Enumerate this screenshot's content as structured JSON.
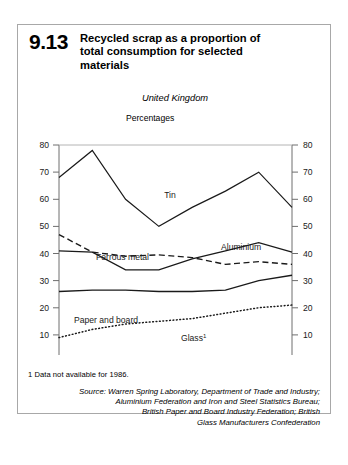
{
  "figure": {
    "number": "9.13",
    "title_line1": "Recycled scrap as a proportion of",
    "title_line2": "total consumption for selected",
    "title_line3": "materials",
    "region": "United Kingdom",
    "units": "Percentages"
  },
  "footnote": {
    "text": "1  Data not available for 1986."
  },
  "source": {
    "line1": "Source: Warren Spring Laboratory, Department of Trade and Industry;",
    "line2": "Aluminium Federation and Iron and Steel Statistics Bureau;",
    "line3": "British Paper and Board Industry Federation; British",
    "line4": "Glass Manufacturers Confederation"
  },
  "axis": {
    "y_ticks": [
      "80",
      "70",
      "60",
      "50",
      "40",
      "30",
      "20",
      "10",
      "0"
    ],
    "x_ticks": [
      "1984",
      "1986",
      "1988",
      "1991"
    ]
  },
  "series_labels": {
    "tin": "Tin",
    "ferrous": "Ferrous metal",
    "aluminium": "Aluminium",
    "paper": "Paper and board",
    "glass": "Glass",
    "glass_footnote_mark": "1"
  },
  "chart_data": {
    "type": "line",
    "title": "Recycled scrap as a proportion of total consumption for selected materials",
    "subtitle": "United Kingdom",
    "xlabel": "",
    "ylabel": "Percentages",
    "ylim": [
      0,
      80
    ],
    "xlim": [
      1984,
      1991
    ],
    "ytick_values": [
      0,
      10,
      20,
      30,
      40,
      50,
      60,
      70,
      80
    ],
    "xtick_values": [
      1984,
      1986,
      1988,
      1991
    ],
    "grid": false,
    "legend": "inline-annotations",
    "x": [
      1984,
      1985,
      1986,
      1987,
      1988,
      1989,
      1990,
      1991
    ],
    "series": [
      {
        "name": "Tin",
        "style": "solid",
        "color": "#1a1a1a",
        "values": [
          68,
          78,
          60,
          50,
          57,
          63,
          70,
          57
        ]
      },
      {
        "name": "Ferrous metal",
        "style": "dashed",
        "color": "#1a1a1a",
        "values": [
          47,
          40.5,
          39,
          39.5,
          38.5,
          36,
          37,
          36
        ]
      },
      {
        "name": "Aluminium",
        "style": "solid",
        "color": "#1a1a1a",
        "values": [
          41,
          40.5,
          34,
          34,
          38,
          41,
          44,
          40.5
        ]
      },
      {
        "name": "Paper and board",
        "style": "solid",
        "color": "#1a1a1a",
        "values": [
          26,
          26.5,
          26.5,
          26,
          26,
          26.5,
          30,
          32
        ]
      },
      {
        "name": "Glass",
        "style": "dotted",
        "color": "#1a1a1a",
        "values": [
          9,
          12,
          14,
          15,
          16,
          18,
          20,
          21
        ],
        "note": "Data not available for 1986"
      }
    ]
  }
}
